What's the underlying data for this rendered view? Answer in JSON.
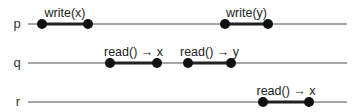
{
  "diagram": {
    "type": "process-timeline",
    "colors": {
      "timeline": "#888888",
      "operation": "#222222",
      "dot": "#111111",
      "text": "#222222"
    },
    "processes": [
      {
        "name": "p",
        "label_x": 17,
        "y": 24,
        "line_start": 28,
        "line_end": 347,
        "operations": [
          {
            "label": "write(x)",
            "start": 42,
            "end": 88
          },
          {
            "label": "write(y)",
            "start": 225,
            "end": 268
          }
        ]
      },
      {
        "name": "q",
        "label_x": 17,
        "y": 63,
        "line_start": 28,
        "line_end": 347,
        "operations": [
          {
            "label": "read() → x",
            "start": 110,
            "end": 157
          },
          {
            "label": "read() → y",
            "start": 188,
            "end": 231
          }
        ]
      },
      {
        "name": "r",
        "label_x": 18,
        "y": 102,
        "line_start": 28,
        "line_end": 347,
        "operations": [
          {
            "label": "read() → x",
            "start": 263,
            "end": 309
          }
        ]
      }
    ]
  }
}
